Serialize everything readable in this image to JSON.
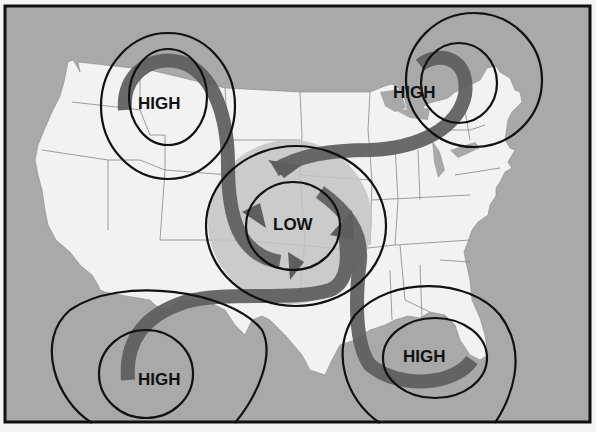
{
  "diagram": {
    "title": "",
    "colors": {
      "background": "#f4f4f4",
      "water": "#a9a9a9",
      "land": "#f2f2f2",
      "low_halo": "#c4c4c4",
      "wind_arrow": "#5e5e5e",
      "isobar": "#111111",
      "frame": "#111111"
    },
    "systems": [
      {
        "id": "high-northwest",
        "label": "HIGH",
        "type": "high-pressure",
        "location": "Montana / northern Rockies"
      },
      {
        "id": "high-northeast",
        "label": "HIGH",
        "type": "high-pressure",
        "location": "Great Lakes"
      },
      {
        "id": "low-center",
        "label": "LOW",
        "type": "low-pressure",
        "location": "Central Plains"
      },
      {
        "id": "high-southwest",
        "label": "HIGH",
        "type": "high-pressure",
        "location": "Northern Mexico"
      },
      {
        "id": "high-southeast",
        "label": "HIGH",
        "type": "high-pressure",
        "location": "Gulf of Mexico / Florida"
      }
    ],
    "legend": []
  }
}
